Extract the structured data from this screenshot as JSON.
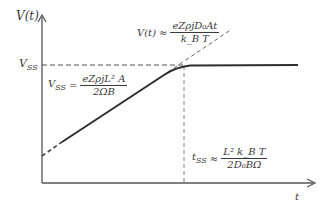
{
  "diagram": {
    "type": "steady-state voltage vs time plot",
    "axes": {
      "y_label": "V(t)",
      "x_label": "t"
    },
    "annotations": {
      "vss_tick": "V",
      "vss_tick_sub": "SS",
      "vss_eq_lhs": "V",
      "vss_eq_lhs_sub": "SS",
      "vss_eq_rel": "=",
      "vss_eq_num": "eZρjL² A",
      "vss_eq_den": "2ΩB",
      "linear_eq_lhs": "V(t)",
      "linear_eq_rel": "≈",
      "linear_eq_num": "eZρjD₀At",
      "linear_eq_den": "k_B T",
      "tss_eq_lhs": "t",
      "tss_eq_lhs_sub": "SS",
      "tss_eq_rel": "≈",
      "tss_eq_num": "L² k_B T",
      "tss_eq_den": "2D₀BΩ"
    },
    "colors": {
      "line": "#2e2e2e",
      "axis": "#555555",
      "dashed": "#555555"
    }
  }
}
